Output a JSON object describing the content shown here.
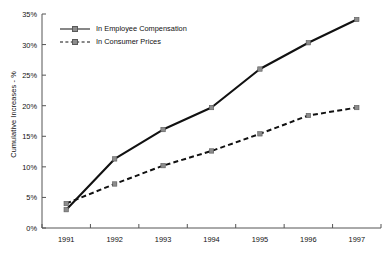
{
  "chart_data": {
    "type": "line",
    "title": "",
    "xlabel": "",
    "ylabel": "Cumulative Increases - %",
    "categories": [
      "1991",
      "1992",
      "1993",
      "1994",
      "1995",
      "1996",
      "1997"
    ],
    "x": [
      1991,
      1992,
      1993,
      1994,
      1995,
      1996,
      1997
    ],
    "ylim": [
      0,
      35
    ],
    "yticks": [
      0,
      5,
      10,
      15,
      20,
      25,
      30,
      35
    ],
    "ytick_labels": [
      "0%",
      "5%",
      "10%",
      "15%",
      "20%",
      "25%",
      "30%",
      "35%"
    ],
    "grid": false,
    "legend_position": "upper-left-inside",
    "series": [
      {
        "name": "In Employee Compensation",
        "style": "solid",
        "color": "#111111",
        "marker": "square",
        "marker_color": "#8c8c8c",
        "values": [
          3.0,
          11.3,
          16.1,
          19.7,
          26.0,
          30.3,
          34.1
        ]
      },
      {
        "name": "In Consumer Prices",
        "style": "dashed",
        "color": "#111111",
        "marker": "square",
        "marker_color": "#8c8c8c",
        "values": [
          4.0,
          7.2,
          10.2,
          12.6,
          15.4,
          18.4,
          19.7
        ]
      }
    ]
  },
  "axis": {
    "y_title": "Cumulative Increases - %"
  },
  "legend": {
    "items": [
      {
        "label": "In Employee Compensation"
      },
      {
        "label": "In Consumer Prices"
      }
    ]
  },
  "colors": {
    "line": "#111111",
    "marker": "#8c8c8c",
    "axis": "#555555",
    "background": "#ffffff"
  }
}
